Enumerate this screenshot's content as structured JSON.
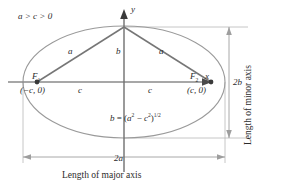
{
  "figure": {
    "type": "ellipse-geometry-diagram",
    "condition": "a > c > 0",
    "axes": {
      "x_label": "x",
      "y_label": "y"
    },
    "foci": {
      "left": {
        "name": "F",
        "index": "1",
        "coord": "(−c, 0)"
      },
      "right": {
        "name": "F",
        "index": "2",
        "coord": "(c, 0)"
      }
    },
    "triangle_labels": {
      "left_side": "a",
      "center_side": "b",
      "right_side": "a"
    },
    "center_to_focus": {
      "left": "c",
      "right": "c"
    },
    "formula": {
      "lhs": "b",
      "eq": " = (",
      "a_var": "a",
      "a_exp": "2",
      "minus": " − ",
      "c_var": "c",
      "c_exp": "2",
      "close": ")",
      "power": "1/2"
    },
    "dimensions": {
      "major": {
        "value": "2a",
        "caption": "Length of major axis"
      },
      "minor": {
        "value": "2b",
        "caption": "Length of minor axis"
      }
    },
    "colors": {
      "background": "#ffffff",
      "ellipse_stroke": "#9a9a9a",
      "axis_stroke": "#8a8a8a",
      "triangle_stroke": "#7a7a7a",
      "dimension_stroke": "#b4b4b4",
      "focus_dot": "#3a3a3a",
      "text": "#2b2b2b"
    },
    "geometry": {
      "center_x": 124,
      "center_y": 82,
      "semi_major_px": 101,
      "semi_minor_px": 56,
      "focus_offset_px": 87,
      "top_vertex_y": 27
    }
  }
}
